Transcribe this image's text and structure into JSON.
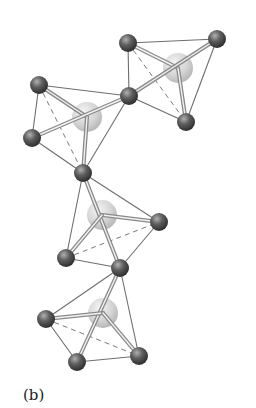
{
  "figure": {
    "panel_label": "(b)",
    "colors": {
      "background": "#ffffff",
      "bond_line": "#6e6e6e",
      "double_bond_outer": "#8a8a8a",
      "double_bond_inner": "#f2f2f2",
      "dashed_line": "#7a7a7a",
      "small_atom_dark": "#3a3a3a",
      "small_atom_light": "#a8a8a8",
      "large_atom_dark": "#b9b9b9",
      "large_atom_light": "#f0f0f0"
    },
    "atoms": [
      {
        "id": "A",
        "type": "small",
        "x": 128,
        "y": 43,
        "r": 9
      },
      {
        "id": "B",
        "type": "small",
        "x": 217,
        "y": 39,
        "r": 9
      },
      {
        "id": "C",
        "type": "small",
        "x": 129,
        "y": 96,
        "r": 9
      },
      {
        "id": "D",
        "type": "small",
        "x": 186,
        "y": 122,
        "r": 9
      },
      {
        "id": "P",
        "type": "small",
        "x": 39,
        "y": 85,
        "r": 9
      },
      {
        "id": "Q",
        "type": "small",
        "x": 32,
        "y": 138,
        "r": 9
      },
      {
        "id": "R",
        "type": "small",
        "x": 83,
        "y": 173,
        "r": 9
      },
      {
        "id": "S",
        "type": "small",
        "x": 159,
        "y": 222,
        "r": 9
      },
      {
        "id": "T",
        "type": "small",
        "x": 66,
        "y": 258,
        "r": 9
      },
      {
        "id": "U",
        "type": "small",
        "x": 120,
        "y": 268,
        "r": 9
      },
      {
        "id": "V",
        "type": "small",
        "x": 46,
        "y": 319,
        "r": 9
      },
      {
        "id": "W",
        "type": "small",
        "x": 77,
        "y": 362,
        "r": 9
      },
      {
        "id": "X",
        "type": "small",
        "x": 139,
        "y": 356,
        "r": 9
      },
      {
        "id": "L1",
        "type": "large",
        "x": 178,
        "y": 68,
        "r": 15
      },
      {
        "id": "L2",
        "type": "large",
        "x": 87,
        "y": 117,
        "r": 15
      },
      {
        "id": "L3",
        "type": "large",
        "x": 102,
        "y": 215,
        "r": 15
      },
      {
        "id": "L4",
        "type": "large",
        "x": 103,
        "y": 313,
        "r": 15
      }
    ],
    "units": [
      {
        "name": "tetrahedron-1",
        "center": "L1",
        "edges": [
          [
            "A",
            "B"
          ],
          [
            "A",
            "C"
          ],
          [
            "B",
            "D"
          ],
          [
            "C",
            "D"
          ]
        ],
        "dashed": [
          [
            "A",
            "D"
          ]
        ],
        "double": [
          [
            "A",
            "L1"
          ],
          [
            "C",
            "B"
          ],
          [
            "L1",
            "D"
          ]
        ]
      },
      {
        "name": "tetrahedron-2",
        "center": "L2",
        "edges": [
          [
            "P",
            "C"
          ],
          [
            "P",
            "Q"
          ],
          [
            "Q",
            "R"
          ],
          [
            "C",
            "R"
          ]
        ],
        "dashed": [
          [
            "P",
            "R"
          ]
        ],
        "double": [
          [
            "P",
            "L2"
          ],
          [
            "Q",
            "C"
          ],
          [
            "L2",
            "R"
          ]
        ]
      },
      {
        "name": "tetrahedron-3",
        "center": "L3",
        "edges": [
          [
            "R",
            "S"
          ],
          [
            "R",
            "T"
          ],
          [
            "T",
            "U"
          ],
          [
            "S",
            "U"
          ]
        ],
        "dashed": [
          [
            "T",
            "S"
          ]
        ],
        "double": [
          [
            "R",
            "U"
          ],
          [
            "L3",
            "S"
          ],
          [
            "L3",
            "T"
          ]
        ]
      },
      {
        "name": "tetrahedron-4",
        "center": "L4",
        "edges": [
          [
            "U",
            "V"
          ],
          [
            "U",
            "X"
          ],
          [
            "V",
            "W"
          ],
          [
            "W",
            "X"
          ]
        ],
        "dashed": [
          [
            "V",
            "X"
          ]
        ],
        "double": [
          [
            "U",
            "W"
          ],
          [
            "L4",
            "V"
          ],
          [
            "L4",
            "X"
          ]
        ]
      }
    ]
  }
}
